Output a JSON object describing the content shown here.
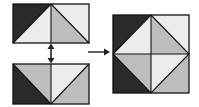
{
  "diagram": {
    "colors": {
      "dark": "#2a2a2a",
      "light": "#ececec",
      "mid": "#bdbdbd",
      "stroke": "#111111",
      "arrow": "#222222"
    },
    "top_rect": {
      "x": 13,
      "y": 4,
      "w": 76,
      "h": 39
    },
    "bottom_rect": {
      "x": 13,
      "y": 64,
      "w": 76,
      "h": 40
    },
    "square": {
      "x": 113,
      "y": 15,
      "w": 76,
      "h": 78
    },
    "double_arrow": {
      "x": 51,
      "y1": 44,
      "y2": 63
    },
    "right_arrow": {
      "x1": 88,
      "x2": 110,
      "y": 52
    }
  }
}
